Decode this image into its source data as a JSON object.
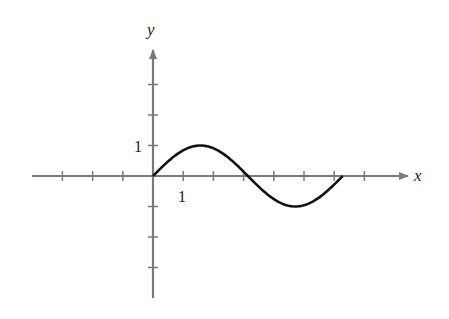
{
  "chart_data": {
    "type": "line",
    "title": "",
    "xlabel": "x",
    "ylabel": "y",
    "xlim": [
      -4,
      7
    ],
    "ylim": [
      -4,
      3
    ],
    "x_tick_label": "1",
    "y_tick_label": "1",
    "x_ticks": [
      -3,
      -2,
      -1,
      1,
      2,
      3,
      4,
      5,
      6,
      7
    ],
    "y_ticks": [
      -3,
      -2,
      -1,
      1,
      2,
      3
    ],
    "grid": false,
    "series": [
      {
        "name": "y = sin x",
        "x": [
          0,
          0.785,
          1.571,
          2.356,
          3.142,
          3.927,
          4.712,
          5.498,
          6.283
        ],
        "values": [
          0,
          0.707,
          1,
          0.707,
          0,
          -0.707,
          -1,
          -0.707,
          0
        ]
      }
    ]
  },
  "colors": {
    "axis": "#7a7a7a",
    "curve": "#111111"
  }
}
